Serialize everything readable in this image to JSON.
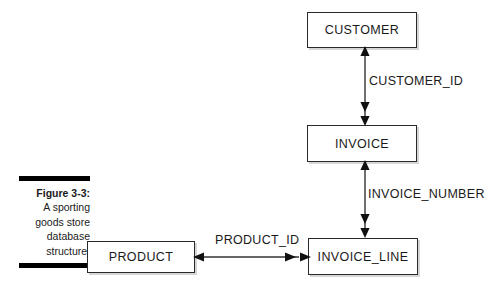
{
  "figure": {
    "caption_title": "Figure 3-3:",
    "caption_lines": [
      "A sporting",
      "goods store",
      "database",
      "structure."
    ]
  },
  "diagram": {
    "type": "entity-relationship",
    "entities": [
      {
        "id": "customer",
        "label": "CUSTOMER"
      },
      {
        "id": "invoice",
        "label": "INVOICE"
      },
      {
        "id": "invoice_line",
        "label": "INVOICE_LINE"
      },
      {
        "id": "product",
        "label": "PRODUCT"
      }
    ],
    "relationships": [
      {
        "id": "customer-invoice",
        "label": "CUSTOMER_ID",
        "from": "CUSTOMER",
        "to": "INVOICE",
        "orientation": "vertical",
        "from_cardinality": "one",
        "to_cardinality": "many"
      },
      {
        "id": "invoice-invoice_line",
        "label": "INVOICE_NUMBER",
        "from": "INVOICE",
        "to": "INVOICE_LINE",
        "orientation": "vertical",
        "from_cardinality": "one",
        "to_cardinality": "many"
      },
      {
        "id": "product-invoice_line",
        "label": "PRODUCT_ID",
        "from": "PRODUCT",
        "to": "INVOICE_LINE",
        "orientation": "horizontal",
        "from_cardinality": "one",
        "to_cardinality": "many"
      }
    ]
  },
  "colors": {
    "background": "#ffffff",
    "box_border": "#2a2a2a",
    "text": "#1a1a1a",
    "connector": "#333333",
    "caption_rule": "#000000"
  }
}
